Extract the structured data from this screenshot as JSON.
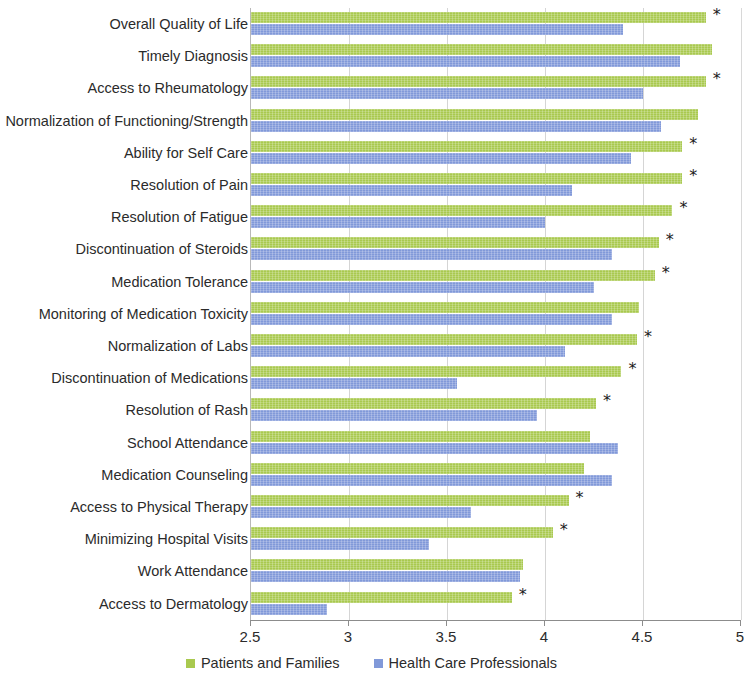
{
  "chart_data": {
    "type": "bar",
    "orientation": "horizontal",
    "title": "",
    "xlabel": "",
    "ylabel": "",
    "xlim": [
      2.5,
      5.0
    ],
    "xticks": [
      "2.5",
      "3",
      "3.5",
      "4",
      "4.5",
      "5"
    ],
    "xtick_values": [
      2.5,
      3,
      3.5,
      4,
      4.5,
      5
    ],
    "grid": true,
    "legend_position": "bottom",
    "annotation_symbol": "*",
    "colors": {
      "patients_and_families": "#a9c94f",
      "health_care_professionals": "#8199d9"
    },
    "categories": [
      "Overall Quality of Life",
      "Timely Diagnosis",
      "Access to Rheumatology",
      "Normalization of Functioning/Strength",
      "Ability for Self Care",
      "Resolution of Pain",
      "Resolution of Fatigue",
      "Discontinuation of Steroids",
      "Medication Tolerance",
      "Monitoring of Medication Toxicity",
      "Normalization of Labs",
      "Discontinuation of Medications",
      "Resolution of Rash",
      "School Attendance",
      "Medication Counseling",
      "Access to Physical Therapy",
      "Minimizing Hospital Visits",
      "Work Attendance",
      "Access to Dermatology"
    ],
    "series": [
      {
        "name": "Patients and Families",
        "color": "#a9c94f",
        "values": [
          4.82,
          4.85,
          4.82,
          4.78,
          4.7,
          4.7,
          4.65,
          4.58,
          4.56,
          4.48,
          4.47,
          4.39,
          4.26,
          4.23,
          4.2,
          4.12,
          4.04,
          3.89,
          3.83
        ]
      },
      {
        "name": "Health Care Professionals",
        "color": "#8199d9",
        "values": [
          4.4,
          4.69,
          4.5,
          4.59,
          4.44,
          4.14,
          4.0,
          4.34,
          4.25,
          4.34,
          4.1,
          3.55,
          3.96,
          4.37,
          4.34,
          3.62,
          3.41,
          3.87,
          2.89
        ]
      }
    ],
    "significance": [
      true,
      false,
      true,
      false,
      true,
      true,
      true,
      true,
      true,
      false,
      true,
      true,
      true,
      false,
      false,
      true,
      true,
      false,
      true
    ]
  },
  "legend": {
    "entries": [
      {
        "label": "Patients and Families",
        "color": "#a9c94f"
      },
      {
        "label": "Health Care Professionals",
        "color": "#8199d9"
      }
    ]
  }
}
